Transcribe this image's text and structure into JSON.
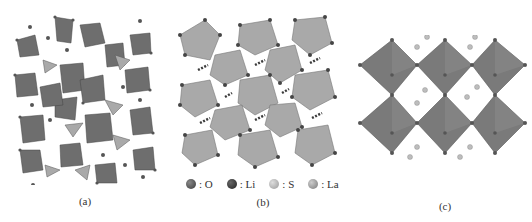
{
  "panels": [
    {
      "id": "a",
      "caption": "(a)"
    },
    {
      "id": "b",
      "caption": "(b)"
    },
    {
      "id": "c",
      "caption": "(c)"
    }
  ],
  "legend": [
    {
      "symbol": "sphere",
      "label": ": O",
      "color": "#4a4a4a"
    },
    {
      "symbol": "sphere",
      "label": ": Li",
      "color": "#2e2e2e"
    },
    {
      "symbol": "sphere",
      "label": ": S",
      "color": "#a8a8a8"
    },
    {
      "symbol": "sphere",
      "label": ": La",
      "color": "#8c8c8c"
    }
  ],
  "colors": {
    "polyhedron_dark": "#6e6e6e",
    "polyhedron_light": "#a9a9a9",
    "polyhedron_mid": "#858585",
    "atom": "#555555"
  }
}
